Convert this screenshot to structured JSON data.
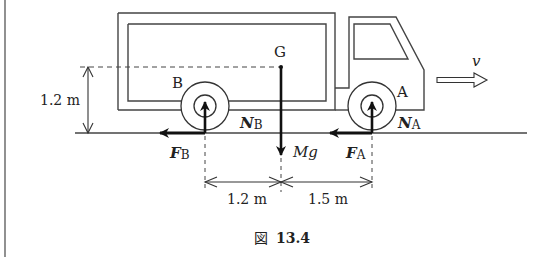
{
  "figure": {
    "caption_prefix": "図",
    "caption_number": "13.4"
  },
  "labels": {
    "G": "G",
    "A": "A",
    "B": "B",
    "v": "v",
    "NA_main": "N",
    "NA_sub": "A",
    "NB_main": "N",
    "NB_sub": "B",
    "FA_main": "F",
    "FA_sub": "A",
    "FB_main": "F",
    "FB_sub": "B",
    "Mg": "Mg"
  },
  "dimensions": {
    "height_cg": "1.2 m",
    "dist_B_to_G": "1.2 m",
    "dist_G_to_A": "1.5 m"
  },
  "colors": {
    "line": "#333333",
    "arrow": "#111111",
    "background": "#ffffff"
  }
}
